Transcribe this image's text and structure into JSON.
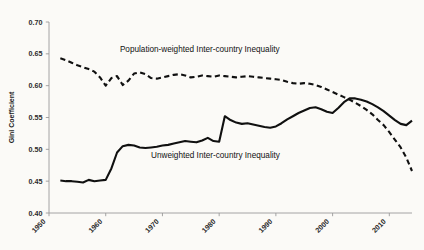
{
  "chart_data": {
    "type": "line",
    "title": "",
    "subtitle": "",
    "xlabel": "",
    "ylabel": "Gini Coefficient",
    "xlim": [
      1950,
      2014
    ],
    "ylim": [
      0.4,
      0.7
    ],
    "grid": false,
    "legend_position": "inline-annotations",
    "x_ticks": [
      "1950",
      "1960",
      "1970",
      "1980",
      "1990",
      "2000",
      "2010"
    ],
    "x_tick_values": [
      1950,
      1960,
      1970,
      1980,
      1990,
      2000,
      2010
    ],
    "y_ticks": [
      "0.40",
      "0.45",
      "0.50",
      "0.55",
      "0.60",
      "0.65",
      "0.70"
    ],
    "y_tick_values": [
      0.4,
      0.45,
      0.5,
      0.55,
      0.6,
      0.65,
      0.7
    ],
    "series": [
      {
        "name": "Population-weighted Inter-country Inequality",
        "style": "dashed",
        "color": "#101010",
        "x": [
          1952,
          1953,
          1954,
          1955,
          1956,
          1957,
          1958,
          1959,
          1960,
          1961,
          1962,
          1963,
          1964,
          1965,
          1966,
          1967,
          1968,
          1969,
          1970,
          1971,
          1972,
          1973,
          1974,
          1975,
          1976,
          1977,
          1978,
          1979,
          1980,
          1981,
          1982,
          1983,
          1984,
          1985,
          1986,
          1987,
          1988,
          1989,
          1990,
          1991,
          1992,
          1993,
          1994,
          1995,
          1996,
          1997,
          1998,
          1999,
          2000,
          2001,
          2002,
          2003,
          2004,
          2005,
          2006,
          2007,
          2008,
          2009,
          2010,
          2011,
          2012,
          2013,
          2014
        ],
        "values": [
          0.643,
          0.64,
          0.636,
          0.632,
          0.629,
          0.626,
          0.622,
          0.613,
          0.6,
          0.612,
          0.615,
          0.601,
          0.608,
          0.619,
          0.621,
          0.618,
          0.612,
          0.611,
          0.613,
          0.615,
          0.617,
          0.618,
          0.616,
          0.613,
          0.614,
          0.616,
          0.615,
          0.614,
          0.616,
          0.615,
          0.614,
          0.613,
          0.614,
          0.615,
          0.614,
          0.613,
          0.612,
          0.611,
          0.61,
          0.609,
          0.606,
          0.604,
          0.603,
          0.604,
          0.603,
          0.601,
          0.598,
          0.594,
          0.59,
          0.586,
          0.582,
          0.578,
          0.573,
          0.568,
          0.562,
          0.555,
          0.546,
          0.538,
          0.527,
          0.515,
          0.503,
          0.487,
          0.466
        ]
      },
      {
        "name": "Unweighted Inter-country Inequality",
        "style": "solid",
        "color": "#101010",
        "x": [
          1952,
          1953,
          1954,
          1955,
          1956,
          1957,
          1958,
          1959,
          1960,
          1961,
          1962,
          1963,
          1964,
          1965,
          1966,
          1967,
          1968,
          1969,
          1970,
          1971,
          1972,
          1973,
          1974,
          1975,
          1976,
          1977,
          1978,
          1979,
          1980,
          1981,
          1982,
          1983,
          1984,
          1985,
          1986,
          1987,
          1988,
          1989,
          1990,
          1991,
          1992,
          1993,
          1994,
          1995,
          1996,
          1997,
          1998,
          1999,
          2000,
          2001,
          2002,
          2003,
          2004,
          2005,
          2006,
          2007,
          2008,
          2009,
          2010,
          2011,
          2012,
          2013,
          2014
        ],
        "values": [
          0.451,
          0.45,
          0.45,
          0.449,
          0.448,
          0.452,
          0.45,
          0.451,
          0.452,
          0.47,
          0.495,
          0.505,
          0.507,
          0.506,
          0.503,
          0.502,
          0.503,
          0.504,
          0.506,
          0.507,
          0.509,
          0.511,
          0.513,
          0.512,
          0.511,
          0.514,
          0.518,
          0.513,
          0.512,
          0.552,
          0.546,
          0.542,
          0.54,
          0.541,
          0.539,
          0.537,
          0.535,
          0.534,
          0.536,
          0.541,
          0.547,
          0.552,
          0.557,
          0.561,
          0.565,
          0.566,
          0.563,
          0.559,
          0.557,
          0.565,
          0.574,
          0.58,
          0.58,
          0.578,
          0.575,
          0.571,
          0.566,
          0.56,
          0.553,
          0.546,
          0.54,
          0.538,
          0.545
        ]
      }
    ],
    "annotations": [
      {
        "text": "Population-weighted Inter-country Inequality",
        "x": 1962.5,
        "y": 0.6525,
        "anchor": "start"
      },
      {
        "text": "Unweighted Inter-country Inequality",
        "x": 1968.0,
        "y": 0.4865,
        "anchor": "start"
      }
    ]
  },
  "background_artifacts": [
    "scanned page with faint bleed-through text",
    "off-white paper background"
  ]
}
